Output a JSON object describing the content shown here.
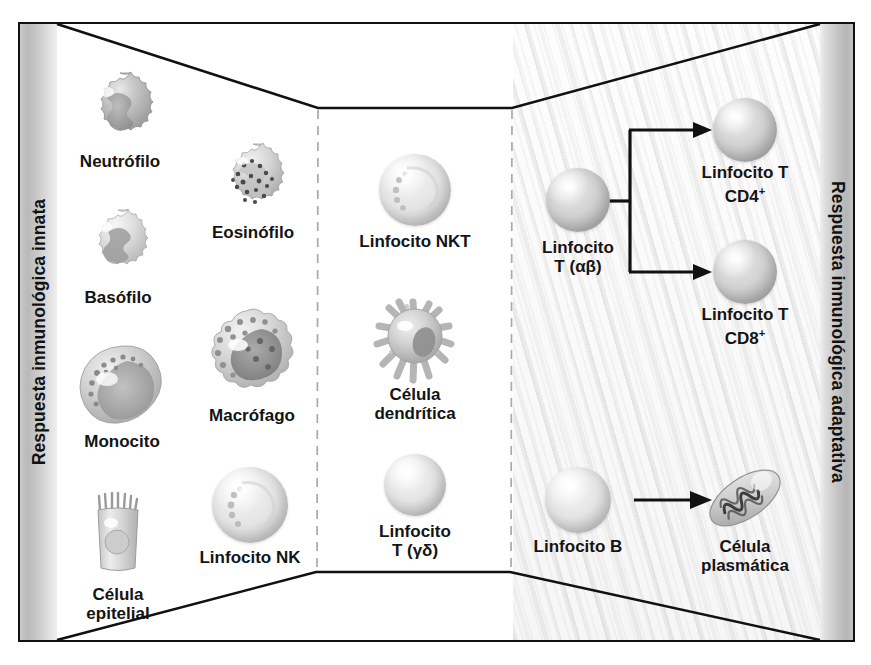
{
  "figure": {
    "left_band_label": "Respuesta inmunológica innata",
    "right_band_label": "Respuesta inmunológica adaptativa",
    "accent_colors": {
      "outline": "#111111",
      "band_gray": "#c2c2c2",
      "cell_gray": "#cfcfcf",
      "text": "#141414"
    }
  },
  "innate": {
    "cells": [
      {
        "id": "neutrofilo",
        "label": "Neutrófilo",
        "x": 120,
        "y": 110
      },
      {
        "id": "eosinofilo",
        "label": "Eosinófilo",
        "x": 253,
        "y": 180
      },
      {
        "id": "basofilo",
        "label": "Basófilo",
        "x": 118,
        "y": 245
      },
      {
        "id": "monocito",
        "label": "Monocito",
        "x": 122,
        "y": 385
      },
      {
        "id": "macrofago",
        "label": "Macrófago",
        "x": 252,
        "y": 355
      },
      {
        "id": "linfocito-nk",
        "label": "Linfocito NK",
        "x": 250,
        "y": 505
      },
      {
        "id": "celula-epitelial",
        "label": "Célula\nepitelial",
        "x": 118,
        "y": 535
      }
    ]
  },
  "bridge": {
    "cells": [
      {
        "id": "linfocito-nkt",
        "label": "Linfocito NKT",
        "x": 415,
        "y": 190
      },
      {
        "id": "celula-dendritica",
        "label": "Célula\ndendrítica",
        "x": 415,
        "y": 340
      },
      {
        "id": "linfocito-t-gd",
        "label": "Linfocito\nT (γδ)",
        "x": 415,
        "y": 485
      }
    ]
  },
  "adaptive": {
    "cells": [
      {
        "id": "linfocito-t-ab",
        "label": "Linfocito\nT (αβ)",
        "x": 578,
        "y": 200
      },
      {
        "id": "linfocito-t-cd4",
        "label": "Linfocito T CD4",
        "sup": "+",
        "x": 745,
        "y": 130
      },
      {
        "id": "linfocito-t-cd8",
        "label": "Linfocito T CD8",
        "sup": "+",
        "x": 745,
        "y": 272
      },
      {
        "id": "linfocito-b",
        "label": "Linfocito B",
        "x": 578,
        "y": 500
      },
      {
        "id": "celula-plasmatica",
        "label": "Célula plasmática",
        "x": 745,
        "y": 500
      }
    ],
    "connectors": [
      {
        "id": "t-ab-split",
        "from": "linfocito-t-ab",
        "to": [
          "linfocito-t-cd4",
          "linfocito-t-cd8"
        ],
        "type": "bracket"
      },
      {
        "id": "b-to-plasma",
        "from": "linfocito-b",
        "to": [
          "celula-plasmatica"
        ],
        "type": "arrow"
      }
    ]
  },
  "dividers": [
    {
      "id": "divider-left",
      "x": 318,
      "style": "dashed"
    },
    {
      "id": "divider-right",
      "x": 512,
      "style": "dashed"
    }
  ]
}
